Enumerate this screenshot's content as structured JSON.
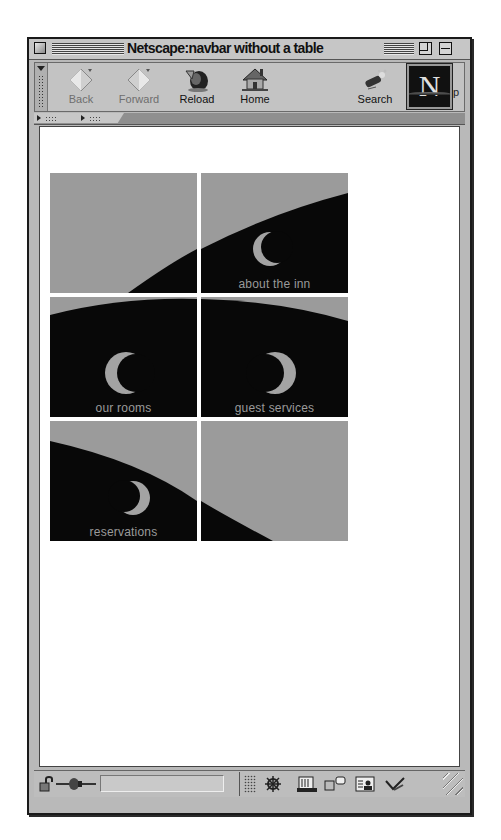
{
  "window": {
    "title": "Netscape:navbar without a table"
  },
  "toolbar": {
    "buttons": [
      {
        "label": "Back",
        "icon": "back-arrow-icon",
        "enabled": false
      },
      {
        "label": "Forward",
        "icon": "forward-arrow-icon",
        "enabled": false
      },
      {
        "label": "Reload",
        "icon": "reload-icon",
        "enabled": true
      },
      {
        "label": "Home",
        "icon": "home-icon",
        "enabled": true
      },
      {
        "label": "Search",
        "icon": "search-flashlight-icon",
        "enabled": true
      }
    ],
    "throbber_letter": "N",
    "overflow_char": "p"
  },
  "tabs_bar": {
    "tabs": [
      {
        "icon": "disclosure-triangle-icon"
      },
      {
        "icon": "disclosure-triangle-icon"
      }
    ]
  },
  "navbar": {
    "tiles": [
      {
        "caption": "",
        "link": false
      },
      {
        "caption": "about the inn",
        "link": true
      },
      {
        "caption": "our rooms",
        "link": true
      },
      {
        "caption": "guest services",
        "link": true
      },
      {
        "caption": "reservations",
        "link": true
      },
      {
        "caption": "",
        "link": false
      }
    ],
    "colors": {
      "sky": "#9b9b9b",
      "night": "#080808",
      "moon": "#a3a3a3"
    }
  },
  "statusbar": {
    "status_text": "",
    "icons": [
      "security-lock-icon",
      "connection-plug-icon",
      "navigator-icon",
      "mail-icon",
      "discussions-icon",
      "address-book-icon",
      "composer-icon"
    ]
  }
}
